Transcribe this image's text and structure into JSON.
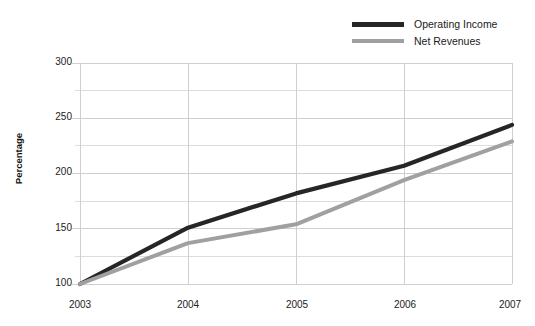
{
  "chart_data": {
    "type": "line",
    "title": "",
    "subtitle": "",
    "xlabel": "",
    "ylabel": "Percentage",
    "categories": [
      "2003",
      "2004",
      "2005",
      "2006",
      "2007"
    ],
    "x": [
      2003,
      2004,
      2005,
      2006,
      2007
    ],
    "series": [
      {
        "name": "Operating Income",
        "color": "#262626",
        "values": [
          100,
          151,
          182,
          207,
          244
        ]
      },
      {
        "name": "Net Revenues",
        "color": "#a0a0a0",
        "values": [
          100,
          137,
          154,
          194,
          229
        ]
      }
    ],
    "ylim": [
      100,
      300
    ],
    "xlim": [
      2003,
      2007
    ],
    "yticks": [
      100,
      150,
      200,
      250,
      300
    ],
    "ytick_labels": [
      "100",
      "150",
      "200",
      "250",
      "300"
    ],
    "yminor_ticks": [
      125,
      175,
      225,
      275
    ],
    "xticks": [
      2003,
      2004,
      2005,
      2006,
      2007
    ],
    "xtick_labels": [
      "2003",
      "2004",
      "2005",
      "2006",
      "2007"
    ],
    "grid": true,
    "grid_color": "#cfcfcf",
    "minor_grid_color": "#dddddd",
    "legend_position": "top-right",
    "background": "#ffffff"
  },
  "legend": {
    "items": [
      {
        "label": "Operating Income",
        "color": "#262626"
      },
      {
        "label": "Net Revenues",
        "color": "#a0a0a0"
      }
    ]
  },
  "axes": {
    "y_title": "Percentage",
    "y_labels": [
      "300",
      "250",
      "200",
      "150",
      "100"
    ],
    "x_labels": [
      "2003",
      "2004",
      "2005",
      "2006",
      "2007"
    ]
  }
}
